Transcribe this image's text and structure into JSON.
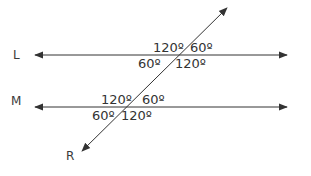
{
  "diagram": {
    "type": "parallel lines cut by a transversal",
    "lines": [
      {
        "name": "L",
        "angles": {
          "top_left": "120º",
          "top_right": "60º",
          "bottom_left": "60º",
          "bottom_right": "120º"
        }
      },
      {
        "name": "M",
        "angles": {
          "top_left": "120º",
          "top_right": "60º",
          "bottom_left": "60º",
          "bottom_right": "120º"
        }
      }
    ],
    "transversal": {
      "name": "R"
    },
    "colors": {
      "stroke": "#333333",
      "background": "#ffffff"
    }
  }
}
